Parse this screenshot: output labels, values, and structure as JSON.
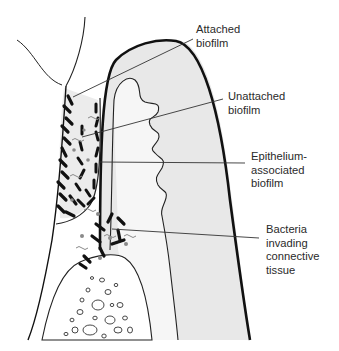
{
  "diagram": {
    "colors": {
      "outline": "#1a1a1a",
      "tissue_fill": "#e6e6e6",
      "pocket_fill": "#ededed",
      "bacteria": "#111111",
      "bacteria_grey": "#8a8a8a",
      "leader_line": "#333333",
      "text": "#2a2a2a"
    },
    "labels": [
      {
        "id": "attached",
        "lines": [
          "Attached",
          "biofilm"
        ]
      },
      {
        "id": "unattached",
        "lines": [
          "Unattached",
          "biofilm"
        ]
      },
      {
        "id": "epithelium",
        "lines": [
          "Epithelium-",
          "associated",
          "biofilm"
        ]
      },
      {
        "id": "invading",
        "lines": [
          "Bacteria",
          "invading",
          "connective",
          "tissue"
        ]
      }
    ]
  }
}
